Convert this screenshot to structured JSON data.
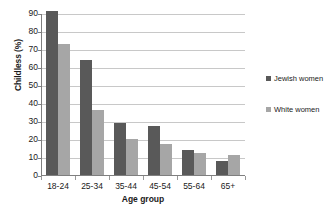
{
  "chart_data": {
    "type": "bar",
    "title": "",
    "subtitle": "",
    "xlabel": "Age group",
    "ylabel": "Childless (%)",
    "categories": [
      "18-24",
      "25-34",
      "35-44",
      "45-54",
      "55-64",
      "65+"
    ],
    "series": [
      {
        "name": "Jewish women",
        "color": "#595959",
        "values": [
          91,
          64,
          29,
          27,
          14,
          8
        ]
      },
      {
        "name": "White women",
        "color": "#a6a6a6",
        "values": [
          73,
          36,
          20,
          17,
          12,
          11
        ]
      }
    ],
    "ylim": [
      0,
      90
    ],
    "ytick_step": 10,
    "yticks": [
      "90",
      "80",
      "70",
      "60",
      "50",
      "40",
      "30",
      "20",
      "10",
      "0"
    ],
    "grid": "horizontal",
    "legend_position": "right",
    "background": "#ffffff",
    "gridline_color": "#c8c8c8",
    "axis_color": "#7f7f7f",
    "text_color": "#1a1a1a"
  }
}
